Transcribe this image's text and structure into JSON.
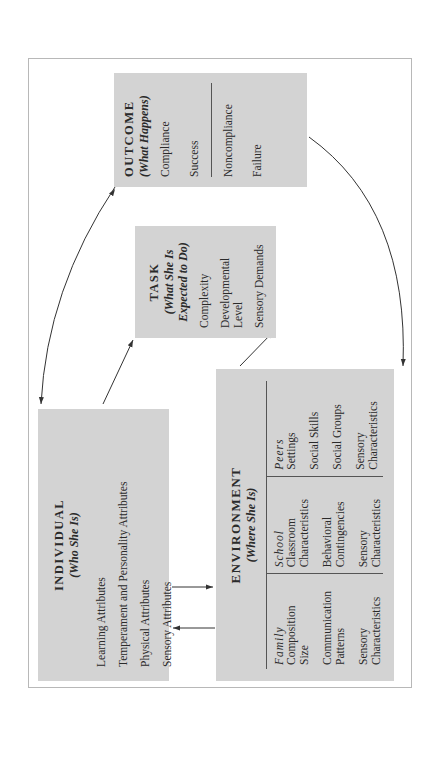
{
  "individual": {
    "title": "INDIVIDUAL",
    "subtitle": "(Who She Is)",
    "items": [
      "Learning Attributes",
      "Temperament and Personality Attributes",
      "Physical Attributes",
      "Sensory Attributes"
    ]
  },
  "environment": {
    "title": "ENVIRONMENT",
    "subtitle": "(Where She Is)",
    "columns": [
      {
        "heading": "Family",
        "items": [
          "Composition",
          "Size",
          "Communication Patterns",
          "Sensory Characteristics"
        ]
      },
      {
        "heading": "School",
        "items": [
          "Classroom Characteristics",
          "Behavioral Contingencies",
          "Sensory Characteristics"
        ]
      },
      {
        "heading": "Peers",
        "items": [
          "Settings",
          "Social Skills",
          "Social Groups",
          "Sensory Characteristics"
        ]
      }
    ]
  },
  "task": {
    "title": "TASK",
    "subtitle_line1": "(What She Is",
    "subtitle_line2": "Expected to Do)",
    "items": [
      "Complexity",
      "Developmental Level",
      "Sensory Demands"
    ]
  },
  "outcome": {
    "title": "OUTCOME",
    "subtitle": "(What Happens)",
    "positive": [
      "Compliance",
      "Success"
    ],
    "negative": [
      "Noncompliance",
      "Failure"
    ]
  },
  "colors": {
    "box_fill": "#d3d3d3",
    "frame_border": "#b8b8b8",
    "line": "#333333"
  }
}
